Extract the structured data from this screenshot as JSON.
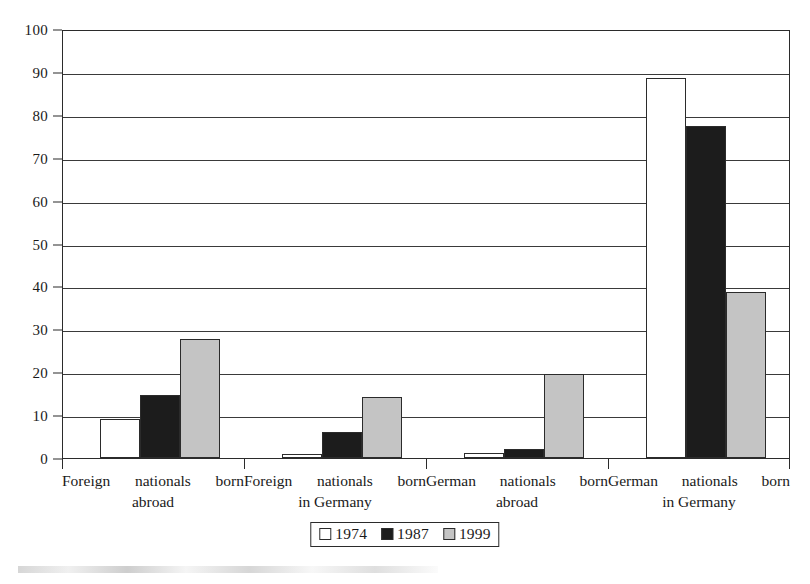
{
  "chart_data": {
    "type": "bar",
    "title": "",
    "subtitle": "",
    "xlabel": "",
    "ylabel": "",
    "ylim": [
      0,
      100
    ],
    "yticks": [
      0,
      10,
      20,
      30,
      40,
      50,
      60,
      70,
      80,
      90,
      100
    ],
    "ytick_labels": [
      "0",
      "10",
      "20",
      "30",
      "40",
      "50",
      "60",
      "70",
      "80",
      "90",
      "100"
    ],
    "grid": true,
    "legend_position": "bottom-center",
    "categories": [
      {
        "line1": "Foreign nationals born",
        "line2": "abroad"
      },
      {
        "line1": "Foreign nationals born",
        "line2": "in Germany"
      },
      {
        "line1": "German nationals born",
        "line2": "abroad"
      },
      {
        "line1": "German nationals born",
        "line2": "in Germany"
      }
    ],
    "category_labels": [
      "Foreign nationals born abroad",
      "Foreign nationals born in Germany",
      "German nationals born abroad",
      "German nationals born in Germany"
    ],
    "series": [
      {
        "name": "1974",
        "color": "#ffffff",
        "edge_color": "#2b2b2b",
        "values": [
          9.0,
          1.0,
          1.2,
          88.5
        ]
      },
      {
        "name": "1987",
        "color": "#1c1c1c",
        "edge_color": "#2b2b2b",
        "values": [
          14.7,
          6.0,
          2.0,
          77.5
        ]
      },
      {
        "name": "1999",
        "color": "#c4c4c4",
        "edge_color": "#2b2b2b",
        "values": [
          27.7,
          14.2,
          19.6,
          38.6
        ]
      }
    ]
  },
  "legend": {
    "entries": [
      {
        "label": "1974",
        "swatch": "white-square-swatch"
      },
      {
        "label": "1987",
        "swatch": "black-square-swatch"
      },
      {
        "label": "1999",
        "swatch": "gray-square-swatch"
      }
    ]
  }
}
